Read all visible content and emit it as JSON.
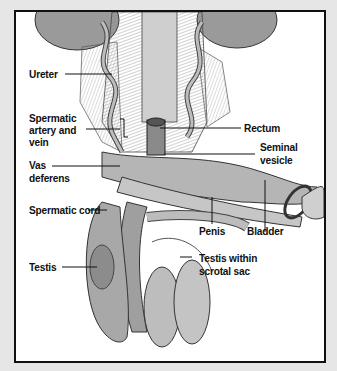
{
  "diagram": {
    "type": "anatomical illustration",
    "colors": {
      "background": "#e6e6e6",
      "frame_border": "#111111",
      "panel": "#ffffff",
      "label_text": "#111111"
    },
    "labels": {
      "ureter": "Ureter",
      "spermatic_artery_1": "Spermatic",
      "spermatic_artery_2": "artery and",
      "spermatic_artery_3": "vein",
      "vas_deferens_1": "Vas",
      "vas_deferens_2": "deferens",
      "spermatic_cord": "Spermatic cord",
      "testis": "Testis",
      "rectum": "Rectum",
      "seminal_vesicle_1": "Seminal",
      "seminal_vesicle_2": "vesicle",
      "penis": "Penis",
      "bladder": "Bladder",
      "testis_scrotal_1": "Testis within",
      "testis_scrotal_2": "scrotal sac"
    }
  }
}
